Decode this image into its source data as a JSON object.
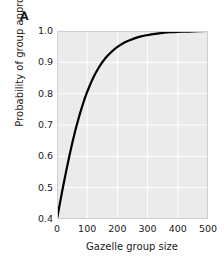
{
  "chart_data": {
    "type": "line",
    "panel_label": "A",
    "title": "",
    "xlabel": "Gazelle group size",
    "ylabel": "Probability of group approaching",
    "xlim": [
      0,
      500
    ],
    "ylim": [
      0.4,
      1.0
    ],
    "xticks": [
      0,
      100,
      200,
      300,
      400,
      500
    ],
    "xtick_labels": [
      "0",
      "100",
      "200",
      "300",
      "400",
      "500"
    ],
    "yticks": [
      0.4,
      0.5,
      0.6,
      0.7,
      0.8,
      0.9,
      1.0
    ],
    "ytick_labels": [
      "0.4",
      "0.5",
      "0.6",
      "0.7",
      "0.8",
      "0.9",
      "1.0"
    ],
    "grid": true,
    "grid_color": "#ffffff",
    "plot_background": "#ebebeb",
    "legend": null,
    "series": [
      {
        "name": "Probability of group approaching",
        "color": "#000000",
        "line_width": 2.2,
        "x": [
          0,
          10,
          20,
          30,
          40,
          50,
          60,
          70,
          80,
          90,
          100,
          120,
          140,
          160,
          180,
          200,
          225,
          250,
          275,
          300,
          325,
          350,
          375,
          400,
          450,
          500
        ],
        "y": [
          0.4,
          0.452,
          0.503,
          0.551,
          0.597,
          0.64,
          0.68,
          0.716,
          0.749,
          0.779,
          0.806,
          0.851,
          0.886,
          0.913,
          0.933,
          0.949,
          0.964,
          0.974,
          0.982,
          0.987,
          0.991,
          0.994,
          0.996,
          0.997,
          0.999,
          1.0
        ]
      }
    ]
  }
}
